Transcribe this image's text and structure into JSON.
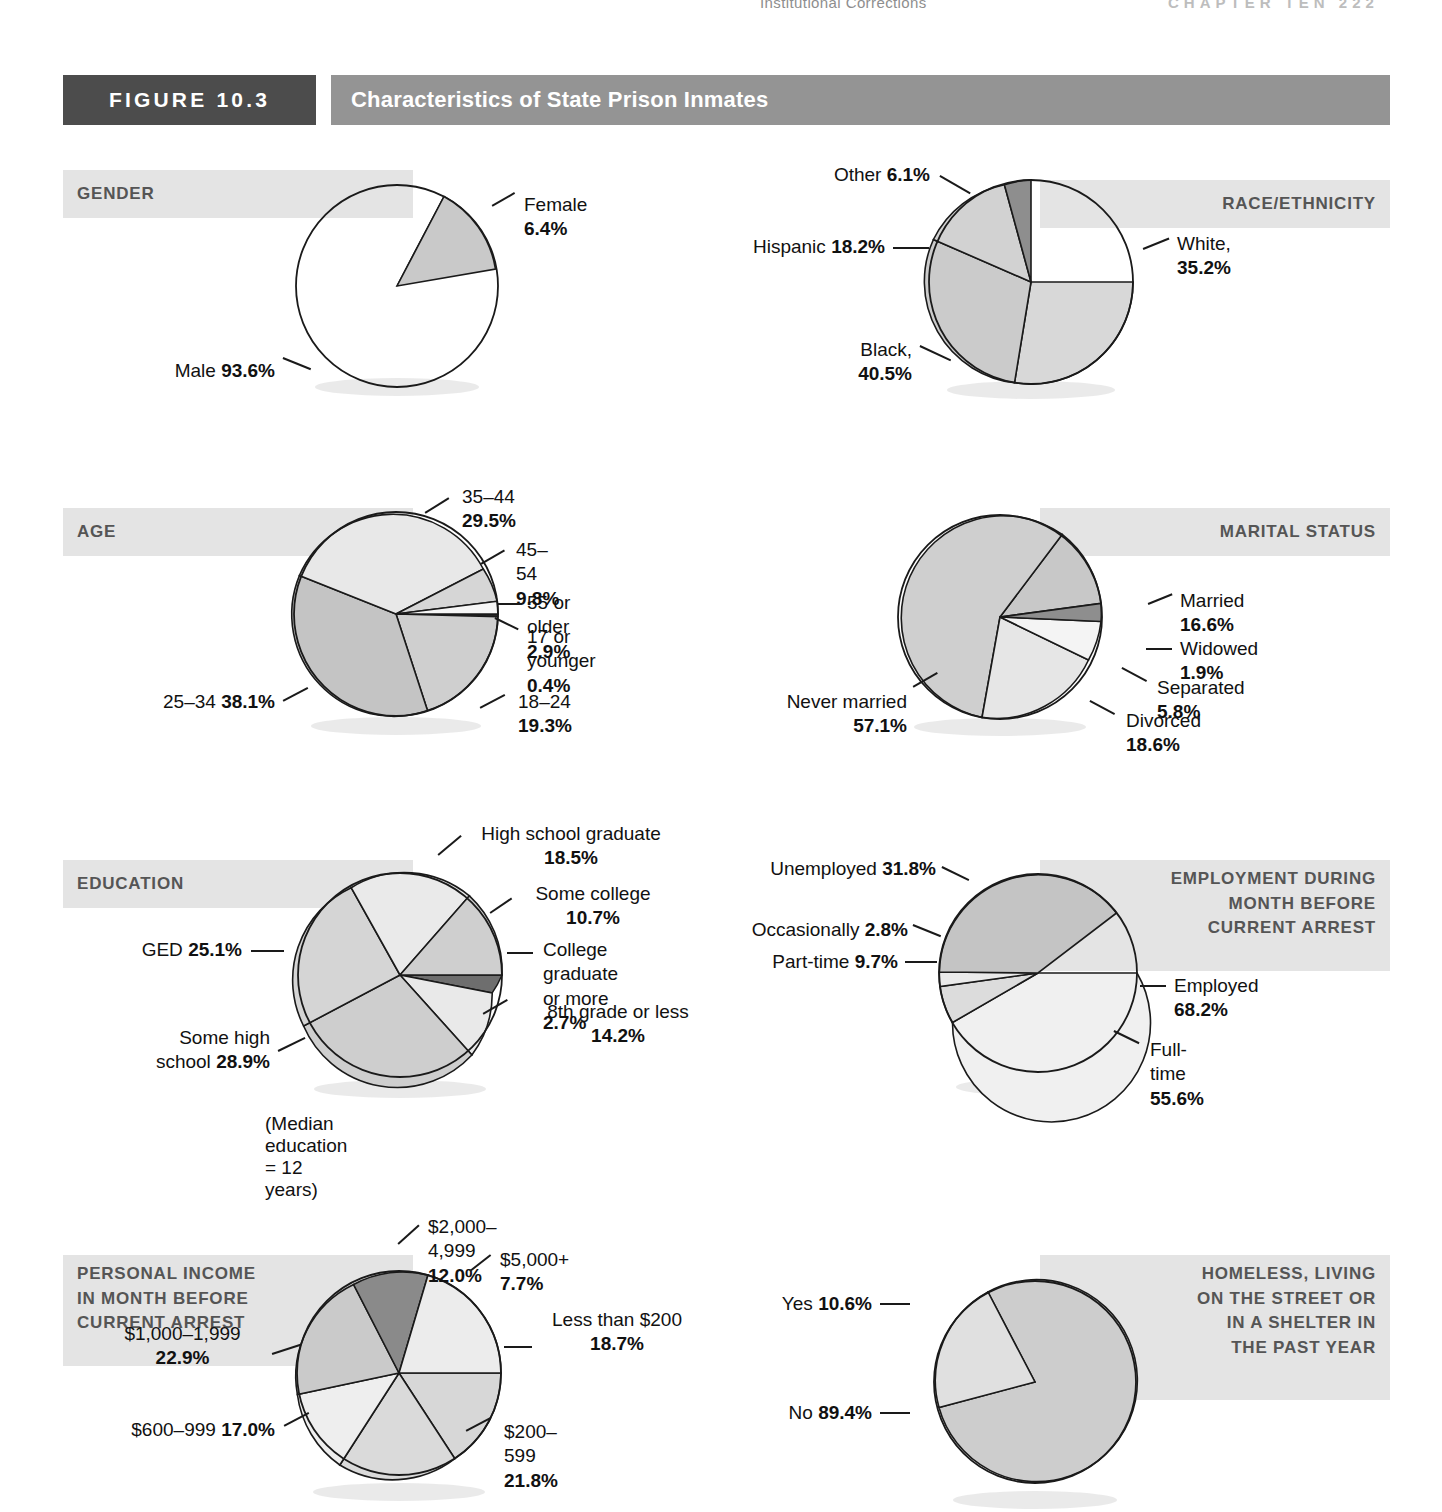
{
  "running_head": {
    "left": "Institutional Corrections",
    "right": "CHAPTER TEN  222"
  },
  "figure": {
    "number_label": "FIGURE 10.3",
    "title": "Characteristics of State Prison Inmates"
  },
  "footnote": "(Median education = 12 years)",
  "colors": {
    "fig_number_bg": "#4c4c4c",
    "fig_title_bg": "#949494",
    "section_band_bg": "#e4e4e4",
    "section_label_text": "#555555",
    "outline": "#1a1a1a"
  },
  "chart_data": [
    {
      "type": "pie",
      "id": "gender",
      "title": "GENDER",
      "labels": [
        "Male",
        "Female"
      ],
      "values": [
        93.6,
        6.4
      ],
      "value_labels": [
        "93.6%",
        "6.4%"
      ],
      "slice_fills": [
        "#ededed",
        "#c9c9c9"
      ],
      "start_angle_deg": 62,
      "direction": "clockwise"
    },
    {
      "type": "pie",
      "id": "race-ethnicity",
      "title": "RACE/ETHNICITY",
      "labels": [
        "White,",
        "Black,",
        "Hispanic",
        "Other"
      ],
      "values": [
        35.2,
        40.5,
        18.2,
        6.1
      ],
      "value_labels": [
        "35.2%",
        "40.5%",
        "18.2%",
        "6.1%"
      ],
      "slice_fills": [
        "#d8d8d8",
        "#cbcbcb",
        "#d2d2d2",
        "#8e8e8e"
      ],
      "start_angle_deg": 95,
      "direction": "clockwise"
    },
    {
      "type": "pie",
      "id": "age",
      "title": "AGE",
      "labels": [
        "17 or younger",
        "18–24",
        "25–34",
        "35–44",
        "45–54",
        "55 or older"
      ],
      "values": [
        0.4,
        19.3,
        38.1,
        29.5,
        9.8,
        2.9
      ],
      "value_labels": [
        "0.4%",
        "19.3%",
        "38.1%",
        "29.5%",
        "9.8%",
        "2.9%"
      ],
      "slice_fills": [
        "#2f2f2f",
        "#cfcfcf",
        "#c4c4c4",
        "#e8e8e8",
        "#d6d6d6",
        "#f4f4f4"
      ],
      "start_angle_deg": 90,
      "direction": "clockwise"
    },
    {
      "type": "pie",
      "id": "marital-status",
      "title": "MARITAL STATUS",
      "labels": [
        "Married",
        "Widowed",
        "Separated",
        "Divorced",
        "Never married"
      ],
      "values": [
        16.6,
        1.9,
        5.8,
        18.6,
        57.1
      ],
      "value_labels": [
        "16.6%",
        "1.9%",
        "5.8%",
        "18.6%",
        "57.1%"
      ],
      "slice_fills": [
        "#c8c8c8",
        "#8e8e8e",
        "#f2f2f2",
        "#e6e6e6",
        "#cfcfcf"
      ],
      "start_angle_deg": 68,
      "direction": "clockwise"
    },
    {
      "type": "pie",
      "id": "education",
      "title": "EDUCATION",
      "labels": [
        "High school graduate",
        "Some college",
        "College graduate or more",
        "8th grade or less",
        "Some high school",
        "GED"
      ],
      "values": [
        18.5,
        10.7,
        2.7,
        14.2,
        28.9,
        25.1
      ],
      "value_labels": [
        "18.5%",
        "10.7%",
        "2.7%",
        "14.2%",
        "28.9%",
        "25.1%"
      ],
      "slice_fills": [
        "#eaeaea",
        "#cfcfcf",
        "#6e6e6e",
        "#e9e9e9",
        "#cecece",
        "#d5d5d5"
      ],
      "start_angle_deg": 83,
      "direction": "clockwise"
    },
    {
      "type": "pie",
      "id": "employment",
      "title": "EMPLOYMENT DURING\nMONTH BEFORE\nCURRENT ARREST",
      "labels": [
        "Employed",
        "Full-time",
        "Part-time",
        "Occasionally",
        "Unemployed"
      ],
      "values": [
        68.2,
        55.6,
        9.7,
        2.8,
        31.8
      ],
      "value_labels": [
        "68.2%",
        "55.6%",
        "9.7%",
        "2.8%",
        "31.8%"
      ],
      "slice_fills": [
        "#d0d0d0",
        "#f0f0f0",
        "#dcdcdc",
        "#c4c4c4"
      ],
      "slice_values": [
        55.6,
        9.7,
        2.8,
        31.8
      ],
      "slice_names": [
        "Full-time",
        "Part-time",
        "Occasionally",
        "Unemployed"
      ],
      "start_angle_deg": 62,
      "direction": "clockwise"
    },
    {
      "type": "pie",
      "id": "income",
      "title": "PERSONAL INCOME\nIN MONTH BEFORE\nCURRENT ARREST",
      "labels": [
        "Less than $200",
        "$200–599",
        "$600–999",
        "$1,000–1,999",
        "$2,000–4,999",
        "$5,000+"
      ],
      "values": [
        18.7,
        21.8,
        17.0,
        22.9,
        12.0,
        7.7
      ],
      "value_labels": [
        "18.7%",
        "21.8%",
        "17.0%",
        "22.9%",
        "12.0%",
        "7.7%"
      ],
      "slice_fills": [
        "#d7d7d7",
        "#dadada",
        "#eeeeee",
        "#cacaca",
        "#8a8a8a",
        "#ececec"
      ],
      "start_angle_deg": 72,
      "direction": "clockwise"
    },
    {
      "type": "pie",
      "id": "homeless",
      "title": "HOMELESS, LIVING\nON THE STREET OR\nIN A SHELTER IN\nTHE PAST YEAR",
      "labels": [
        "Yes",
        "No"
      ],
      "values": [
        10.6,
        89.4
      ],
      "value_labels": [
        "10.6%",
        "89.4%"
      ],
      "slice_fills": [
        "#e0e0e0",
        "#cdcdcd"
      ],
      "start_angle_deg": 118,
      "direction": "counterclockwise"
    }
  ],
  "callouts": {
    "gender": {
      "female": "Female <b>6.4%</b>",
      "male": "Male <b>93.6%</b>"
    },
    "race": {
      "other": "Other <b>6.1%</b>",
      "hispanic": "Hispanic <b>18.2%</b>",
      "black": "Black,\n<b>40.5%</b>",
      "white": "White,\n<b>35.2%</b>"
    },
    "age": {
      "a35_44": "35–44 <b>29.5%</b>",
      "a45_54": "45–54 <b>9.8%</b>",
      "a55plus": "55 or older <b>2.9%</b>",
      "a17under": "17 or younger <b>0.4%</b>",
      "a18_24": "18–24 <b>19.3%</b>",
      "a25_34": "25–34 <b>38.1%</b>"
    },
    "marital": {
      "married": "Married <b>16.6%</b>",
      "widowed": "Widowed <b>1.9%</b>",
      "separated": "Separated <b>5.8%</b>",
      "divorced": "Divorced <b>18.6%</b>",
      "never": "Never married <b>57.1%</b>"
    },
    "education": {
      "hs_grad": "High school graduate\n<b>18.5%</b>",
      "some_college": "Some college\n<b>10.7%</b>",
      "college_grad": "College graduate\nor more <b>2.7%</b>",
      "eighth": "8th grade or less\n<b>14.2%</b>",
      "some_hs": "Some high\nschool <b>28.9%</b>",
      "ged": "GED <b>25.1%</b>"
    },
    "employment": {
      "unemployed": "Unemployed <b>31.8%</b>",
      "occasionally": "Occasionally <b>2.8%</b>",
      "parttime": "Part-time <b>9.7%</b>",
      "employed": "Employed <b>68.2%</b>",
      "fulltime": "Full-time <b>55.6%</b>"
    },
    "income": {
      "i2000": "$2,000–4,999 <b>12.0%</b>",
      "i5000": "$5,000+ <b>7.7%</b>",
      "iless200": "Less than $200\n<b>18.7%</b>",
      "i200": "$200–599 <b>21.8%</b>",
      "i600": "$600–999 <b>17.0%</b>",
      "i1000": "$1,000–1,999\n<b>22.9%</b>"
    },
    "homeless": {
      "yes": "Yes <b>10.6%</b>",
      "no": "No <b>89.4%</b>"
    }
  }
}
